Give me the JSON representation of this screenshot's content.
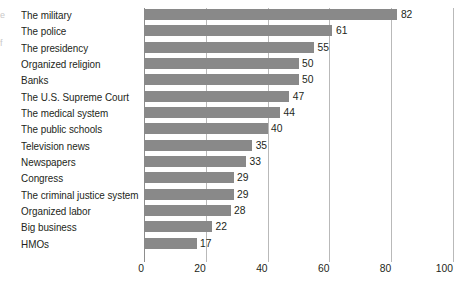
{
  "chart_data": {
    "type": "bar",
    "orientation": "horizontal",
    "title": "",
    "subtitle": "",
    "xlabel": "",
    "ylabel": "",
    "xlim": [
      0,
      100
    ],
    "xticks": [
      0,
      20,
      40,
      60,
      80,
      100
    ],
    "grid": true,
    "legend": false,
    "legend_position": "none",
    "bar_color": "#898989",
    "text_color": "#231f20",
    "gridline_color": "#b9b9b9",
    "background_color": "#ffffff",
    "categories": [
      "The military",
      "The police",
      "The presidency",
      "Organized religion",
      "Banks",
      "The U.S. Supreme Court",
      "The medical system",
      "The public schools",
      "Television news",
      "Newspapers",
      "Congress",
      "The criminal justice system",
      "Organized labor",
      "Big business",
      "HMOs"
    ],
    "values": [
      82,
      61,
      55,
      50,
      50,
      47,
      44,
      40,
      35,
      33,
      29,
      29,
      28,
      22,
      17
    ],
    "value_labels": [
      "82",
      "61",
      "55",
      "50",
      "50",
      "47",
      "44",
      "40",
      "35",
      "33",
      "29",
      "29",
      "28",
      "22",
      "17"
    ],
    "tick_labels": [
      "0",
      "20",
      "40",
      "60",
      "80",
      "100"
    ]
  },
  "edge_fragments": [
    "e",
    "f"
  ]
}
